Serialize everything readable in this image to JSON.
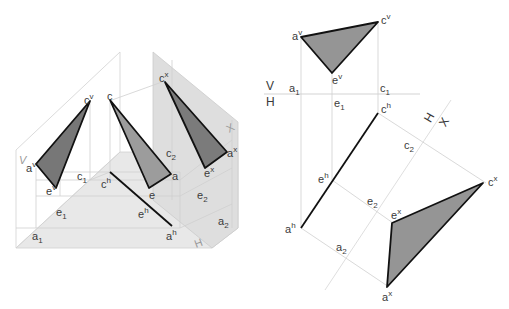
{
  "figure": {
    "colors": {
      "tri_v": "#7a7a7a",
      "tri_true": "#9a9a9a",
      "tri_x": "#7d7d7d",
      "tri_ortho": "#959595",
      "plane_h": "#e6e6e6",
      "plane_x": "#dcdcdc",
      "edge": "#111111",
      "construction": "#cfcfcf"
    }
  },
  "pictorial": {
    "plane_labels": {
      "v": "V",
      "h": "H",
      "x": "X"
    },
    "points": {
      "cv": {
        "base": "c",
        "sup": "v"
      },
      "c": {
        "base": "c",
        "sup": ""
      },
      "cx": {
        "base": "c",
        "sup": "x"
      },
      "av": {
        "base": "a",
        "sup": "v"
      },
      "ev": {
        "base": "e",
        "sup": "v"
      },
      "c1": {
        "base": "c",
        "sub": "1"
      },
      "ch": {
        "base": "c",
        "sup": "h"
      },
      "c2": {
        "base": "c",
        "sub": "2"
      },
      "a": {
        "base": "a",
        "sup": ""
      },
      "e": {
        "base": "e",
        "sup": ""
      },
      "ax": {
        "base": "a",
        "sup": "x"
      },
      "ex": {
        "base": "e",
        "sup": "x"
      },
      "e1": {
        "base": "e",
        "sub": "1"
      },
      "eh": {
        "base": "e",
        "sup": "h"
      },
      "e2": {
        "base": "e",
        "sub": "2"
      },
      "a1": {
        "base": "a",
        "sub": "1"
      },
      "ah": {
        "base": "a",
        "sup": "h"
      },
      "a2": {
        "base": "a",
        "sub": "2"
      }
    }
  },
  "orthographic": {
    "axis_labels": {
      "v": "V",
      "h": "H",
      "hx_h": "H",
      "hx_x": "X"
    },
    "points": {
      "av": {
        "base": "a",
        "sup": "v"
      },
      "cv": {
        "base": "c",
        "sup": "v"
      },
      "ev": {
        "base": "e",
        "sup": "v"
      },
      "a1": {
        "base": "a",
        "sub": "1"
      },
      "e1": {
        "base": "e",
        "sub": "1"
      },
      "c1": {
        "base": "c",
        "sub": "1"
      },
      "ch": {
        "base": "c",
        "sup": "h"
      },
      "c2": {
        "base": "c",
        "sub": "2"
      },
      "eh": {
        "base": "e",
        "sup": "h"
      },
      "e2": {
        "base": "e",
        "sub": "2"
      },
      "ex": {
        "base": "e",
        "sup": "x"
      },
      "cx": {
        "base": "c",
        "sup": "x"
      },
      "ah": {
        "base": "a",
        "sup": "h"
      },
      "a2": {
        "base": "a",
        "sub": "2"
      },
      "ax": {
        "base": "a",
        "sup": "x"
      }
    }
  }
}
